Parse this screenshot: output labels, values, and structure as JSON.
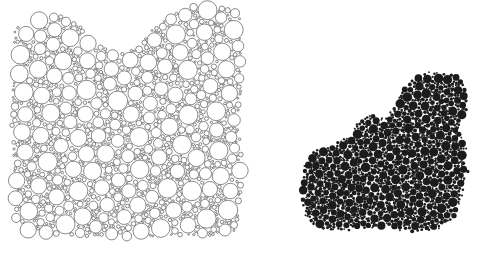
{
  "figure": {
    "title": "",
    "caption": "",
    "background_color": "#ffffff"
  },
  "panels": [
    {
      "id": "panel-left",
      "label": "",
      "render_style": "outline",
      "stroke_color": "#2b2b2b",
      "fill_color": "#ffffff",
      "stroke_width": 0.55,
      "description": "Apollonian-style random circle packing of a fractal-bounded region; unfilled circles with thin dark outlines, radii spanning roughly 0.8 to 9 pixels.",
      "viewbox": [
        0,
        0,
        253,
        253
      ],
      "bounds": {
        "x_min": 10,
        "x_max": 243,
        "y_min": 4,
        "y_max": 239
      }
    },
    {
      "id": "panel-right",
      "label": "",
      "render_style": "filled",
      "stroke_color": "none",
      "fill_color": "#1c1c1c",
      "stroke_width": 0,
      "description": "Same fractal domain rendered as solid dark disks at a coarser, sparser sampling; radii roughly 1 to 4 pixels.",
      "viewbox": [
        0,
        0,
        228,
        253
      ],
      "bounds": {
        "x_min": 47,
        "x_max": 216,
        "y_min": 70,
        "y_max": 233
      }
    }
  ],
  "chart_data": {
    "type": "scatter",
    "title": "",
    "subtitle": "",
    "xlabel": "",
    "ylabel": "",
    "legend": [],
    "grid": false,
    "axis_visible": false,
    "tick_labels_x": [],
    "tick_labels_y": [],
    "series": [
      {
        "name": "circle-packing",
        "panel": "panel-left",
        "marker": "open-circle",
        "color": "#2b2b2b",
        "point_count": 2400,
        "radius_range": [
          0.8,
          9.0
        ],
        "xlim": [
          10,
          243
        ],
        "ylim": [
          4,
          239
        ]
      },
      {
        "name": "filled-disks",
        "panel": "panel-right",
        "marker": "filled-circle",
        "color": "#1c1c1c",
        "point_count": 1500,
        "radius_range": [
          1.0,
          4.2
        ],
        "xlim": [
          47,
          216
        ],
        "ylim": [
          70,
          233
        ]
      }
    ],
    "domain_boundary": {
      "description": "Irregular fractal-like blob boundary shared by both panels; top edge descends from upper right, left edge is near-vertical, bottom edge is ragged.",
      "left_panel_polygon": [
        [
          12,
          46
        ],
        [
          14,
          30
        ],
        [
          22,
          24
        ],
        [
          34,
          24
        ],
        [
          40,
          14
        ],
        [
          56,
          10
        ],
        [
          70,
          18
        ],
        [
          86,
          30
        ],
        [
          100,
          44
        ],
        [
          118,
          52
        ],
        [
          136,
          46
        ],
        [
          150,
          30
        ],
        [
          168,
          14
        ],
        [
          190,
          6
        ],
        [
          214,
          4
        ],
        [
          236,
          6
        ],
        [
          243,
          18
        ],
        [
          243,
          96
        ],
        [
          238,
          120
        ],
        [
          242,
          150
        ],
        [
          243,
          186
        ],
        [
          240,
          214
        ],
        [
          236,
          232
        ],
        [
          214,
          238
        ],
        [
          182,
          236
        ],
        [
          150,
          239
        ],
        [
          116,
          237
        ],
        [
          84,
          238
        ],
        [
          52,
          236
        ],
        [
          26,
          233
        ],
        [
          14,
          220
        ],
        [
          11,
          186
        ],
        [
          13,
          150
        ],
        [
          10,
          116
        ],
        [
          12,
          80
        ]
      ],
      "right_panel_polygon": [
        [
          96,
          136
        ],
        [
          104,
          120
        ],
        [
          118,
          112
        ],
        [
          130,
          118
        ],
        [
          140,
          106
        ],
        [
          150,
          88
        ],
        [
          164,
          74
        ],
        [
          182,
          70
        ],
        [
          200,
          72
        ],
        [
          214,
          80
        ],
        [
          216,
          110
        ],
        [
          208,
          126
        ],
        [
          214,
          144
        ],
        [
          216,
          170
        ],
        [
          210,
          196
        ],
        [
          204,
          218
        ],
        [
          186,
          230
        ],
        [
          160,
          233
        ],
        [
          132,
          228
        ],
        [
          110,
          230
        ],
        [
          86,
          232
        ],
        [
          62,
          229
        ],
        [
          50,
          216
        ],
        [
          47,
          190
        ],
        [
          50,
          166
        ],
        [
          60,
          150
        ],
        [
          78,
          142
        ]
      ]
    }
  }
}
